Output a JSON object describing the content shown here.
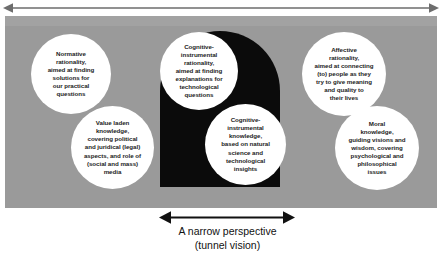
{
  "diagram": {
    "title_caption_line1": "A narrow perspective",
    "title_caption_line2": "(tunnel vision)",
    "top_arrow_name": "full-width-double-arrow",
    "bottom_arrow_name": "narrow-double-arrow",
    "colors": {
      "panel_gray": "#9a9a9a",
      "tunnel_black": "#0b0b0b",
      "circle_white": "#ffffff",
      "text_dark": "#1d1d1d",
      "arrow_black": "#111111"
    }
  },
  "circles": [
    {
      "id": "normative-rationality",
      "text": "Normative\nrationality,\naimed at finding\nsolutions for\nour practical\nquestions"
    },
    {
      "id": "value-laden-knowledge",
      "text": "Value laden\nknowledge,\ncovering political\nand juridical (legal)\naspects, and role of\n(social and mass)\nmedia"
    },
    {
      "id": "cognitive-instrumental-rationality",
      "text": "Cognitive-\ninstrumental\nrationality,\naimed at finding\nexplanations for\ntechnological\nquestions"
    },
    {
      "id": "cognitive-instrumental-knowledge",
      "text": "Cognitive-\ninstrumental\nknowledge,\nbased on natural\nscience and\ntechnological\ninsights"
    },
    {
      "id": "affective-rationality",
      "text": "Affective\nrationality,\naimed at connecting\n(to) people as they\ntry to give meaning\nand quality to\ntheir lives"
    },
    {
      "id": "moral-knowledge",
      "text": "Moral\nknowledge,\nguiding visions and\nwisdom, covering\npsychological and\nphilosophical\nissues"
    }
  ]
}
